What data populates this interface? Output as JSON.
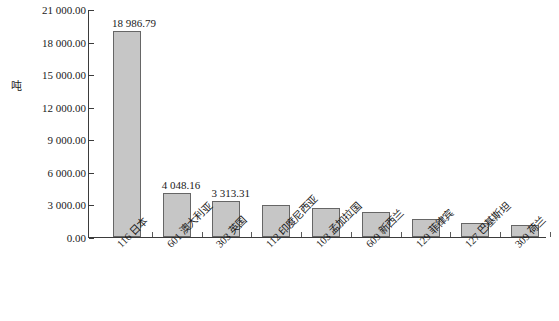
{
  "chart_data": {
    "type": "bar",
    "title": "",
    "subtitle": "",
    "xlabel": "",
    "ylabel": "吨",
    "ylim": [
      0,
      21000
    ],
    "ytick_interval": 3000,
    "grid": false,
    "legend": "none",
    "y_tick_labels": [
      "21 000.00",
      "18 000.00",
      "15 000.00",
      "12 000.00",
      "9 000.00",
      "6 000.00",
      "3 000.00",
      "0.00"
    ],
    "y_tick_values": [
      21000,
      18000,
      15000,
      12000,
      9000,
      6000,
      3000,
      0
    ],
    "categories": [
      "116  日本",
      "601  澳大利亚",
      "303  英国",
      "112  印度尼西亚",
      "103  孟加拉国",
      "609  新西兰",
      "129  菲律宾",
      "127  巴基斯坦",
      "309  荷兰"
    ],
    "category_codes": [
      "116",
      "601",
      "303",
      "112",
      "103",
      "609",
      "129",
      "127",
      "309"
    ],
    "category_names": [
      "日本",
      "澳大利亚",
      "英国",
      "印度尼西亚",
      "孟加拉国",
      "新西兰",
      "菲律宾",
      "巴基斯坦",
      "荷兰"
    ],
    "values": [
      18986.79,
      4048.16,
      3313.31,
      2950.0,
      2650.0,
      2300.0,
      1700.0,
      1300.0,
      1100.0
    ],
    "data_labels": [
      "18 986.79",
      "4 048.16",
      "3 313.31",
      "",
      "",
      "",
      "",
      "",
      ""
    ],
    "bar_fill_color": "#c6c6c6",
    "bar_border_color": "#666666",
    "axis_color": "#3b3b3b",
    "background_color": "#ffffff"
  }
}
